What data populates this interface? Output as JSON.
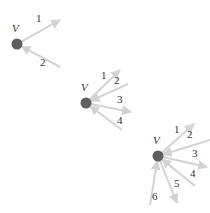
{
  "colors": {
    "vertex": "#5f5f5f",
    "edge": "#d3d3d3",
    "text": "#333333"
  },
  "diagrams": [
    {
      "vertex_label": "V",
      "vertex": {
        "x": 17,
        "y": 44
      },
      "label_pos": {
        "x": 12,
        "y": 32
      },
      "edges": [
        {
          "label": "1",
          "dir": "out",
          "x": 60,
          "y": 20,
          "lx": 36,
          "ly": 22
        },
        {
          "label": "2",
          "dir": "in",
          "x": 60,
          "y": 67,
          "lx": 40,
          "ly": 66
        }
      ]
    },
    {
      "vertex_label": "V",
      "vertex": {
        "x": 86,
        "y": 103
      },
      "label_pos": {
        "x": 81,
        "y": 91
      },
      "edges": [
        {
          "label": "1",
          "dir": "out",
          "x": 120,
          "y": 70,
          "lx": 101,
          "ly": 79
        },
        {
          "label": "2",
          "dir": "in",
          "x": 128,
          "y": 84,
          "lx": 114,
          "ly": 84
        },
        {
          "label": "3",
          "dir": "out",
          "x": 131,
          "y": 112,
          "lx": 117,
          "ly": 103
        },
        {
          "label": "4",
          "dir": "in",
          "x": 122,
          "y": 130,
          "lx": 117,
          "ly": 124
        }
      ]
    },
    {
      "vertex_label": "V",
      "vertex": {
        "x": 158,
        "y": 156
      },
      "label_pos": {
        "x": 153,
        "y": 144
      },
      "edges": [
        {
          "label": "1",
          "dir": "out",
          "x": 194,
          "y": 124,
          "lx": 174,
          "ly": 133
        },
        {
          "label": "2",
          "dir": "in",
          "x": 210,
          "y": 140,
          "lx": 187,
          "ly": 138
        },
        {
          "label": "3",
          "dir": "out",
          "x": 207,
          "y": 167,
          "lx": 192,
          "ly": 157
        },
        {
          "label": "4",
          "dir": "in",
          "x": 195,
          "y": 186,
          "lx": 190,
          "ly": 177
        },
        {
          "label": "5",
          "dir": "out",
          "x": 177,
          "y": 203,
          "lx": 174,
          "ly": 187
        },
        {
          "label": "6",
          "dir": "in",
          "x": 150,
          "y": 205,
          "lx": 152,
          "ly": 200
        }
      ]
    }
  ]
}
